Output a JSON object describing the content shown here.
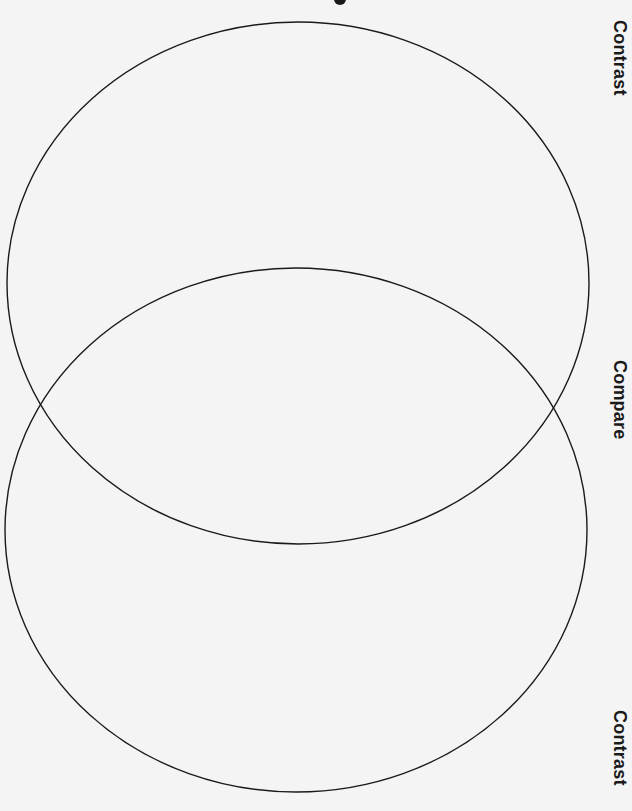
{
  "diagram": {
    "type": "venn",
    "orientation": "vertical",
    "background": "#f4f4f4",
    "stroke_color": "#1a1a1a",
    "circles": [
      {
        "name": "upper",
        "cx": 298,
        "cy": 283,
        "rx": 291,
        "ry": 261
      },
      {
        "name": "lower",
        "cx": 296,
        "cy": 530,
        "rx": 291,
        "ry": 262
      }
    ],
    "labels": {
      "top": "Contrast",
      "middle": "Compare",
      "bottom": "Contrast"
    }
  }
}
